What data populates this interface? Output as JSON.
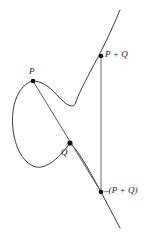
{
  "figure": {
    "stroke_color": "#3a3a3a",
    "line_color": "#5a5a5a",
    "point_color": "#111111",
    "background": "#ffffff",
    "labels": {
      "p": "P",
      "q": "Q",
      "p_plus_q": "P + Q",
      "neg_p_plus_q": "–(P + Q)"
    },
    "points": [
      {
        "name": "P",
        "x": 33,
        "y": 81
      },
      {
        "name": "Q",
        "x": 70,
        "y": 143
      },
      {
        "name": "P + Q",
        "x": 101,
        "y": 56
      },
      {
        "name": "-(P + Q)",
        "x": 101,
        "y": 192
      }
    ],
    "lines": {
      "secant": {
        "from": "P",
        "through": "Q",
        "to": "-(P + Q)"
      },
      "vertical": {
        "from": "-(P + Q)",
        "to": "P + Q",
        "x": 101
      }
    }
  }
}
